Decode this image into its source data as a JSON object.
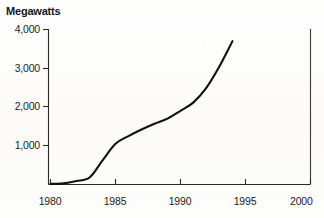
{
  "chart_data": {
    "type": "line",
    "title": "",
    "ylabel": "Megawatts",
    "xlabel": "",
    "ylim": [
      0,
      4000
    ],
    "xlim": [
      1980,
      2000
    ],
    "grid": false,
    "legend": null,
    "yticks": [
      "1,000",
      "2,000",
      "3,000",
      "4,000"
    ],
    "ytick_values": [
      1000,
      2000,
      3000,
      4000
    ],
    "xticks": [
      "1980",
      "1985",
      "1990",
      "1995",
      "2000"
    ],
    "xtick_values": [
      1980,
      1985,
      1990,
      1995,
      2000
    ],
    "x": [
      1980,
      1981,
      1982,
      1983,
      1984,
      1985,
      1986,
      1987,
      1988,
      1989,
      1990,
      1991,
      1992,
      1993,
      1994
    ],
    "values": [
      15,
      30,
      90,
      180,
      620,
      1050,
      1250,
      1420,
      1570,
      1700,
      1900,
      2120,
      2500,
      3050,
      3700
    ],
    "series": [
      {
        "name": "Megawatts",
        "values": [
          15,
          30,
          90,
          180,
          620,
          1050,
          1250,
          1420,
          1570,
          1700,
          1900,
          2120,
          2500,
          3050,
          3700
        ]
      }
    ],
    "line_color": "#111111",
    "axis_color": "#2a2a2a"
  }
}
